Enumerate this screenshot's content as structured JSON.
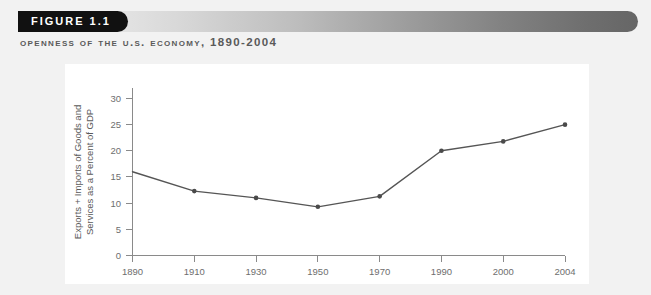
{
  "figure": {
    "badge_label": "FIGURE 1.1",
    "subtitle": "Openness of the U.S. Economy, 1890-2004"
  },
  "colors": {
    "badge_background": "#111111",
    "badge_text": "#ffffff",
    "subtitle_text": "#5a5a5a",
    "panel_background": "#ffffff",
    "outer_background": "#f2f2f2",
    "line": "#555555",
    "marker": "#4a4a4a",
    "axis": "#8a8a8a",
    "tick_label": "#6e6e6e",
    "gradient_start": "#fafafa",
    "gradient_end": "#666666"
  },
  "chart_data": {
    "type": "line",
    "title": "Openness of the U.S. Economy, 1890-2004",
    "xlabel": "",
    "ylabel": "Exports + Imports of Goods and Services as a Percent of GDP",
    "ylabel_lines": [
      "Exports + Imports of Goods and",
      "Services as a Percent of GDP"
    ],
    "categories": [
      "1890",
      "1910",
      "1930",
      "1950",
      "1970",
      "1990",
      "2000",
      "2004"
    ],
    "values": [
      16.0,
      12.3,
      11.0,
      9.3,
      11.3,
      20.0,
      21.8,
      25.0
    ],
    "series": [
      {
        "name": "Exports + Imports as Percent of GDP",
        "values": [
          16.0,
          12.3,
          11.0,
          9.3,
          11.3,
          20.0,
          21.8,
          25.0
        ]
      }
    ],
    "ylim": [
      0,
      32
    ],
    "yticks": [
      0,
      5,
      10,
      15,
      20,
      25,
      30
    ],
    "ytick_labels": [
      "0",
      "5",
      "10",
      "15",
      "20",
      "25",
      "30"
    ],
    "xtick_labels": [
      "1890",
      "1910",
      "1930",
      "1950",
      "1970",
      "1990",
      "2000",
      "2004"
    ],
    "grid": false,
    "legend": false,
    "markers": true,
    "spacing": "categorical"
  }
}
